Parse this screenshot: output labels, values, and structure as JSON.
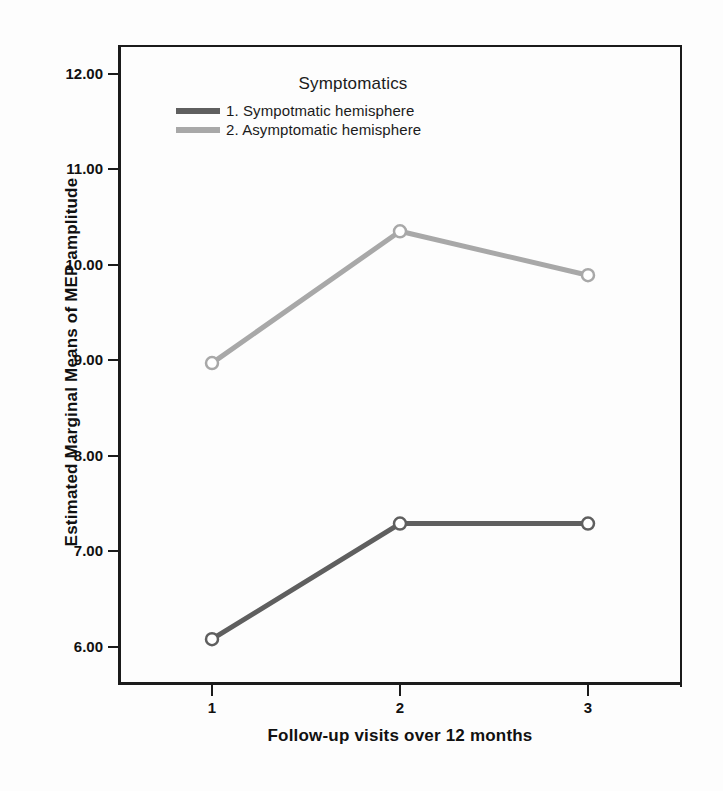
{
  "chart_data": {
    "type": "line",
    "title": "",
    "xlabel": "Follow-up visits over 12 months",
    "ylabel": "Estimated Marginal Means of MEP amplitude",
    "categories": [
      "1",
      "2",
      "3"
    ],
    "x": [
      1,
      2,
      3
    ],
    "xlim": [
      0.5,
      3.5
    ],
    "ylim": [
      5.6,
      12.3
    ],
    "grid": false,
    "legend_position": "inside-top-center",
    "legend_title": "Symptomatics",
    "series": [
      {
        "name": "1. Sympotmatic hemisphere",
        "values": [
          6.08,
          7.29,
          7.29
        ],
        "color": "#5f5f5f",
        "marker": "open-circle"
      },
      {
        "name": "2. Asymptomatic hemisphere",
        "values": [
          8.97,
          10.35,
          9.89
        ],
        "color": "#a8a8a8",
        "marker": "open-circle"
      }
    ],
    "yticks": [
      12.0,
      11.0,
      10.0,
      9.0,
      8.0,
      7.0,
      6.0
    ],
    "ytick_labels": [
      "12.00",
      "11.00",
      "10.00",
      "9.00",
      "8.00",
      "7.00",
      "6.00"
    ],
    "xticks": [
      1,
      2,
      3
    ],
    "xtick_labels": [
      "1",
      "2",
      "3"
    ],
    "axis_color": "#1b1b1b",
    "background": "#ffffff"
  }
}
